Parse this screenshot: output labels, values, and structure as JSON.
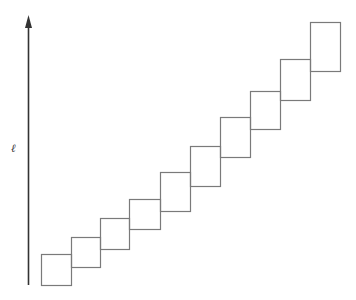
{
  "diagram": {
    "axis": {
      "label": "ℓ",
      "x": 28.5,
      "y_top": 16,
      "y_bottom": 285,
      "color": "#333333"
    },
    "box_stroke_color": "#7a7a7a",
    "boxes": [
      {
        "x": 41,
        "y": 254,
        "w": 30,
        "h": 31
      },
      {
        "x": 71,
        "y": 237,
        "w": 29,
        "h": 30
      },
      {
        "x": 100,
        "y": 218,
        "w": 29,
        "h": 31
      },
      {
        "x": 129,
        "y": 199,
        "w": 31,
        "h": 30
      },
      {
        "x": 160,
        "y": 172,
        "w": 30,
        "h": 39
      },
      {
        "x": 190,
        "y": 146,
        "w": 30,
        "h": 40
      },
      {
        "x": 220,
        "y": 117,
        "w": 30,
        "h": 40
      },
      {
        "x": 250,
        "y": 91,
        "w": 30,
        "h": 38
      },
      {
        "x": 280,
        "y": 59,
        "w": 30,
        "h": 41
      },
      {
        "x": 310,
        "y": 22,
        "w": 30,
        "h": 49
      }
    ]
  }
}
